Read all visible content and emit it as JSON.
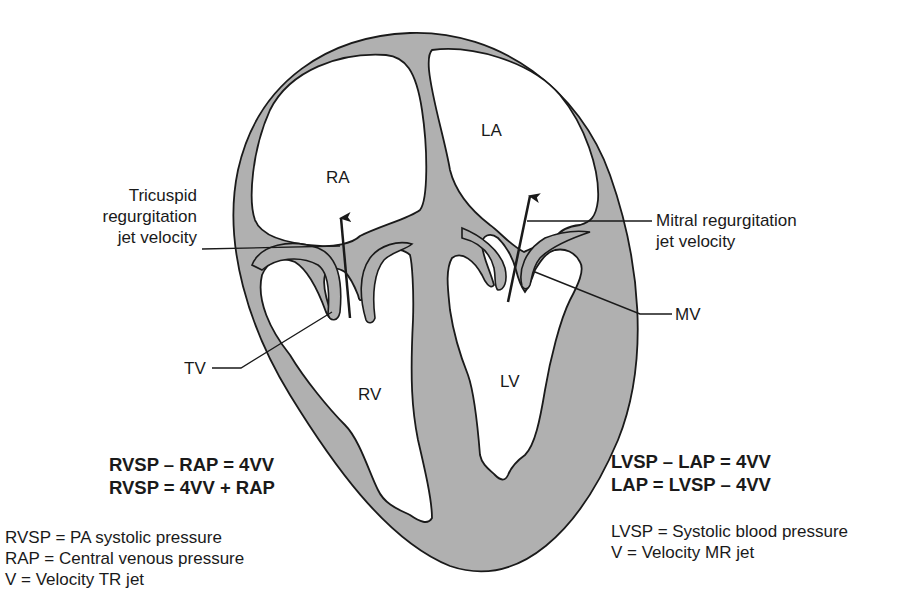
{
  "colors": {
    "muscle": "#b0b0b0",
    "outline": "#1a1a1a",
    "chamber": "#ffffff",
    "text": "#1a1a1a"
  },
  "chambers": {
    "ra": "RA",
    "la": "LA",
    "rv": "RV",
    "lv": "LV"
  },
  "labels": {
    "tricuspid_jet": [
      "Tricuspid",
      "regurgitation",
      "jet velocity"
    ],
    "mitral_jet": [
      "Mitral regurgitation",
      "jet velocity"
    ],
    "tv": "TV",
    "mv": "MV"
  },
  "right_heart": {
    "equations": [
      "RVSP – RAP = 4VV",
      "RVSP = 4VV + RAP"
    ],
    "definitions": [
      "RVSP = PA systolic pressure",
      "RAP = Central venous pressure",
      "V = Velocity TR jet"
    ]
  },
  "left_heart": {
    "equations": [
      "LVSP – LAP = 4VV",
      "LAP = LVSP – 4VV"
    ],
    "definitions": [
      "LVSP = Systolic blood pressure",
      "V = Velocity MR jet"
    ]
  }
}
